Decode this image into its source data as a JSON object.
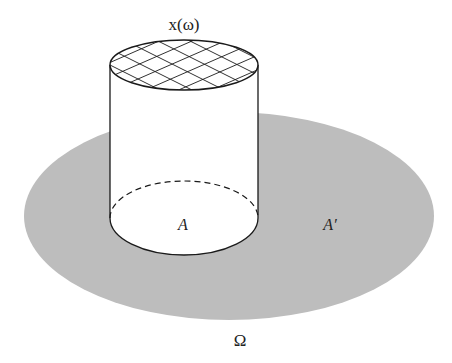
{
  "diagram": {
    "title_label": "x(ω)",
    "inner_region_label": "A",
    "outer_region_label": "A′",
    "sample_space_label": "Ω",
    "colors": {
      "sample_space_fill": "#bdbdbd",
      "stroke": "#1a1a1a",
      "background": "#ffffff",
      "cylinder_fill": "#ffffff"
    },
    "shapes": {
      "sample_space_ellipse": {
        "cx": 229,
        "cy": 216,
        "rx": 205,
        "ry": 104
      },
      "cylinder": {
        "cx": 184,
        "left_x": 110,
        "right_x": 258,
        "top_cy": 65,
        "top_ry": 25,
        "bottom_cy": 218,
        "bottom_ry": 37
      },
      "top_hatch": "crosshatched grid"
    }
  }
}
